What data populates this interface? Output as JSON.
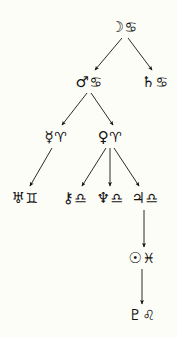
{
  "diagram": {
    "type": "tree",
    "background_color": "#fdfdf8",
    "stroke_color": "#121212",
    "nodes": [
      {
        "id": "moon-cancer",
        "planet_symbol": "☽",
        "planet_name": "Moon",
        "sign_symbol": "♋",
        "sign_name": "Cancer",
        "label": "☽♋",
        "x": 124,
        "y": 27,
        "row": 1
      },
      {
        "id": "mars-cancer",
        "planet_symbol": "♂",
        "planet_name": "Mars",
        "sign_symbol": "♋",
        "sign_name": "Cancer",
        "label": "♂♋",
        "x": 89,
        "y": 82,
        "row": 2
      },
      {
        "id": "saturn-cancer",
        "planet_symbol": "♄",
        "planet_name": "Saturn",
        "sign_symbol": "♋",
        "sign_name": "Cancer",
        "label": "♄♋",
        "x": 155,
        "y": 82,
        "row": 2
      },
      {
        "id": "mercury-aries",
        "planet_symbol": "☿",
        "planet_name": "Mercury",
        "sign_symbol": "♈",
        "sign_name": "Aries",
        "label": "☿♈",
        "x": 56,
        "y": 137,
        "row": 3
      },
      {
        "id": "venus-aries",
        "planet_symbol": "♀",
        "planet_name": "Venus",
        "sign_symbol": "♈",
        "sign_name": "Aries",
        "label": "♀♈",
        "x": 110,
        "y": 137,
        "row": 3
      },
      {
        "id": "uranus-gemini",
        "planet_symbol": "♅",
        "planet_name": "Uranus",
        "sign_symbol": "♊",
        "sign_name": "Gemini",
        "label": "♅♊",
        "x": 25,
        "y": 198,
        "row": 4
      },
      {
        "id": "chiron-libra",
        "planet_symbol": "⚷",
        "planet_name": "Chiron",
        "sign_symbol": "♎",
        "sign_name": "Libra",
        "label": "⚷♎",
        "x": 75,
        "y": 198,
        "row": 4
      },
      {
        "id": "neptune-libra",
        "planet_symbol": "♆",
        "planet_name": "Neptune",
        "sign_symbol": "♎",
        "sign_name": "Libra",
        "label": "♆♎",
        "x": 110,
        "y": 198,
        "row": 4
      },
      {
        "id": "jupiter-libra",
        "planet_symbol": "♃",
        "planet_name": "Jupiter",
        "sign_symbol": "♎",
        "sign_name": "Libra",
        "label": "♃♎",
        "x": 145,
        "y": 198,
        "row": 4
      },
      {
        "id": "sun-pisces",
        "planet_symbol": "☉",
        "planet_name": "Sun",
        "sign_symbol": "♓",
        "sign_name": "Pisces",
        "label": "☉♓",
        "x": 142,
        "y": 258,
        "row": 5
      },
      {
        "id": "pluto-leo",
        "planet_symbol": "♇",
        "planet_name": "Pluto",
        "sign_symbol": "♌",
        "sign_name": "Leo",
        "label": "♇♌",
        "x": 142,
        "y": 315,
        "row": 6
      }
    ],
    "edges": [
      {
        "id": "edge-moon-to-mars",
        "from": "moon-cancer",
        "to": "mars-cancer",
        "x1": 122,
        "y1": 38,
        "x2": 95,
        "y2": 70
      },
      {
        "id": "edge-moon-to-saturn",
        "from": "moon-cancer",
        "to": "saturn-cancer",
        "x1": 128,
        "y1": 38,
        "x2": 152,
        "y2": 70
      },
      {
        "id": "edge-mars-to-mercury",
        "from": "mars-cancer",
        "to": "mercury-aries",
        "x1": 87,
        "y1": 93,
        "x2": 62,
        "y2": 125
      },
      {
        "id": "edge-mars-to-venus",
        "from": "mars-cancer",
        "to": "venus-aries",
        "x1": 91,
        "y1": 93,
        "x2": 113,
        "y2": 125
      },
      {
        "id": "edge-mercury-to-uranus",
        "from": "mercury-aries",
        "to": "uranus-gemini",
        "x1": 52,
        "y1": 148,
        "x2": 30,
        "y2": 186
      },
      {
        "id": "edge-venus-to-chiron",
        "from": "venus-aries",
        "to": "chiron-libra",
        "x1": 106,
        "y1": 148,
        "x2": 82,
        "y2": 186
      },
      {
        "id": "edge-venus-to-neptune",
        "from": "venus-aries",
        "to": "neptune-libra",
        "x1": 110,
        "y1": 148,
        "x2": 110,
        "y2": 186
      },
      {
        "id": "edge-venus-to-jupiter",
        "from": "venus-aries",
        "to": "jupiter-libra",
        "x1": 114,
        "y1": 148,
        "x2": 139,
        "y2": 186
      },
      {
        "id": "edge-jupiter-to-sun",
        "from": "jupiter-libra",
        "to": "sun-pisces",
        "x1": 144,
        "y1": 210,
        "x2": 144,
        "y2": 247
      },
      {
        "id": "edge-sun-to-pluto",
        "from": "sun-pisces",
        "to": "pluto-leo",
        "x1": 142,
        "y1": 269,
        "x2": 142,
        "y2": 304
      }
    ]
  }
}
